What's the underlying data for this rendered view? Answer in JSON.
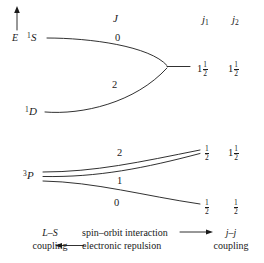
{
  "figure": {
    "type": "energy-level-correlation-diagram",
    "axis": {
      "energy_label": "E",
      "direction": "up"
    },
    "column_headers": {
      "j_center": "J",
      "j1": "j",
      "j1_sub": "1",
      "j2": "j",
      "j2_sub": "2"
    },
    "left_terms": [
      {
        "id": "singlet-S",
        "multiplicity": "1",
        "letter": "S"
      },
      {
        "id": "singlet-D",
        "multiplicity": "1",
        "letter": "D"
      },
      {
        "id": "triplet-P",
        "multiplicity": "3",
        "letter": "P"
      }
    ],
    "j_values": [
      {
        "id": "j-value-1S-0",
        "value": "0"
      },
      {
        "id": "j-value-1D-2",
        "value": "2"
      },
      {
        "id": "j-value-3P-2",
        "value": "2"
      },
      {
        "id": "j-value-3P-1",
        "value": "1"
      },
      {
        "id": "j-value-3P-0",
        "value": "0"
      }
    ],
    "right_states": [
      {
        "id": "jj-state-upper",
        "j1": {
          "whole": "1",
          "num": "1",
          "den": "2"
        },
        "j2": {
          "whole": "1",
          "num": "1",
          "den": "2"
        }
      },
      {
        "id": "jj-state-middle",
        "j1": {
          "whole": "",
          "num": "1",
          "den": "2"
        },
        "j2": {
          "whole": "1",
          "num": "1",
          "den": "2"
        }
      },
      {
        "id": "jj-state-lower",
        "j1": {
          "whole": "",
          "num": "1",
          "den": "2"
        },
        "j2": {
          "whole": "",
          "num": "1",
          "den": "2"
        }
      }
    ],
    "caption": {
      "left_line1": "L–S",
      "left_line2": "coupling",
      "center_line1": "spin–orbit interaction",
      "center_line2": "electronic repulsion",
      "right_line1": "j–j",
      "right_line2": "coupling",
      "arrow_right": "→",
      "arrow_left": "←"
    },
    "colors": {
      "line": "#1a1a1a",
      "text": "#1a1a1a",
      "background": "#ffffff"
    }
  }
}
